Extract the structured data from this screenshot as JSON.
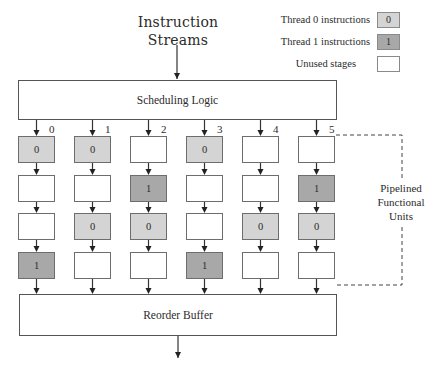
{
  "title": {
    "line1": "Instruction",
    "line2": "Streams"
  },
  "legend": [
    {
      "label": "Thread 0 instructions",
      "glyph": "0",
      "color": "#d4d4d4"
    },
    {
      "label": "Thread 1 instructions",
      "glyph": "1",
      "color": "#a8a8a8"
    },
    {
      "label": "Unused stages",
      "glyph": "",
      "color": "#ffffff"
    }
  ],
  "scheduling_logic": {
    "label": "Scheduling Logic"
  },
  "reorder_buffer": {
    "label": "Reorder Buffer"
  },
  "functional_units_label": {
    "line1": "Pipelined",
    "line2": "Functional",
    "line3": "Units"
  },
  "columns": [
    {
      "index": "0",
      "stages": [
        "0",
        "",
        "",
        "1"
      ]
    },
    {
      "index": "1",
      "stages": [
        "0",
        "",
        "0",
        ""
      ]
    },
    {
      "index": "2",
      "stages": [
        "",
        "1",
        "0",
        ""
      ]
    },
    {
      "index": "3",
      "stages": [
        "0",
        "",
        "",
        "1"
      ]
    },
    {
      "index": "4",
      "stages": [
        "",
        "",
        "0",
        ""
      ]
    },
    {
      "index": "5",
      "stages": [
        "",
        "1",
        "0",
        ""
      ]
    }
  ],
  "colors": {
    "thread0": "#d4d4d4",
    "thread1": "#a8a8a8",
    "unused": "#ffffff",
    "stroke": "#555555"
  }
}
